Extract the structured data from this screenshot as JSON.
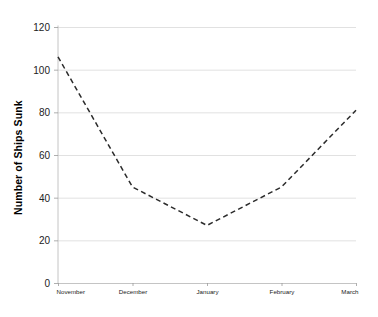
{
  "chart_data": {
    "type": "line",
    "title": "",
    "xlabel": "",
    "ylabel": "Number of Ships Sunk",
    "categories": [
      "November",
      "December",
      "January",
      "February",
      "March"
    ],
    "values": [
      106,
      45,
      27,
      45,
      81
    ],
    "series": [
      {
        "name": "Ships Sunk",
        "values": [
          106,
          45,
          27,
          45,
          81
        ],
        "line_style": "dashed",
        "color": "#2b2b2b"
      }
    ],
    "ylim": [
      0,
      120
    ],
    "yticks": [
      0,
      20,
      40,
      60,
      80,
      100,
      120
    ],
    "ytick_labels": [
      "0",
      "20",
      "40",
      "60",
      "80",
      "100",
      "120"
    ],
    "xtick_labels": [
      "November",
      "December",
      "January",
      "February",
      "March"
    ],
    "grid": true,
    "grid_axis": "y",
    "legend": false,
    "legend_position": "none",
    "background": "#ffffff",
    "grid_color": "#d9d9d9"
  }
}
